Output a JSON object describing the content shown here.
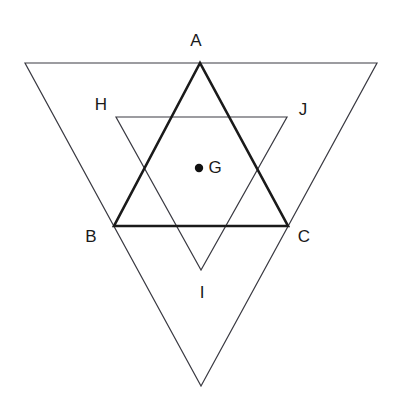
{
  "figure": {
    "background_color": "#ffffff",
    "thin_stroke_color": "#3a3a42",
    "bold_stroke_color": "#1a1a1a",
    "point_color": "#111111",
    "label_color": "#1a1a1a",
    "thin_stroke_width": 1.2,
    "bold_stroke_width": 2.6,
    "width": 397,
    "height": 413
  },
  "labels": {
    "A": "A",
    "B": "B",
    "C": "C",
    "G": "G",
    "H": "H",
    "I": "I",
    "J": "J"
  },
  "label_positions": {
    "A": {
      "x": 196,
      "y": 42
    },
    "B": {
      "x": 91,
      "y": 238
    },
    "C": {
      "x": 304,
      "y": 238
    },
    "G": {
      "x": 215,
      "y": 169
    },
    "H": {
      "x": 101,
      "y": 106
    },
    "I": {
      "x": 202,
      "y": 294
    },
    "J": {
      "x": 303,
      "y": 111
    }
  },
  "chart_data": {
    "type": "diagram",
    "shapes": [
      {
        "name": "outer-inverted-triangle",
        "style": "thin",
        "points": [
          {
            "x": 25,
            "y": 63
          },
          {
            "x": 377,
            "y": 63
          },
          {
            "x": 201,
            "y": 386
          }
        ]
      },
      {
        "name": "triangle-ABC",
        "style": "bold",
        "vertices": [
          "A",
          "B",
          "C"
        ],
        "points": [
          {
            "x": 200,
            "y": 63
          },
          {
            "x": 114,
            "y": 226
          },
          {
            "x": 288,
            "y": 226
          }
        ]
      },
      {
        "name": "triangle-HIJ",
        "style": "thin",
        "vertices": [
          "H",
          "J",
          "I"
        ],
        "points": [
          {
            "x": 116,
            "y": 117
          },
          {
            "x": 287,
            "y": 117
          },
          {
            "x": 201,
            "y": 270
          }
        ]
      }
    ],
    "points": [
      {
        "name": "G",
        "x": 199,
        "y": 168,
        "radius": 4.2,
        "filled": true
      }
    ]
  }
}
